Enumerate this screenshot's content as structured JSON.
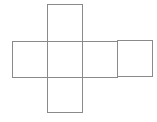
{
  "diagram": {
    "type": "cube-net",
    "stroke_color": "#8a8a8a",
    "background_color": "#ffffff",
    "face_size_px": 35,
    "faces": [
      {
        "id": "top",
        "row": 0,
        "col": 1,
        "label": ""
      },
      {
        "id": "left",
        "row": 1,
        "col": 0,
        "label": ""
      },
      {
        "id": "front",
        "row": 1,
        "col": 1,
        "label": ""
      },
      {
        "id": "right",
        "row": 1,
        "col": 2,
        "label": ""
      },
      {
        "id": "back",
        "row": 1,
        "col": 3,
        "label": ""
      },
      {
        "id": "bottom",
        "row": 2,
        "col": 1,
        "label": ""
      }
    ]
  }
}
